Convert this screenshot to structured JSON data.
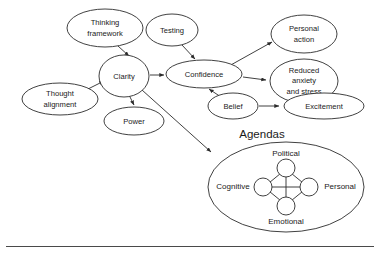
{
  "diagram": {
    "type": "concept-map",
    "background_color": "#ffffff",
    "stroke_color": "#2b2b2b",
    "text_color": "#1a1a1a",
    "nodes": [
      {
        "id": "thinking-framework",
        "label": "Thinking framework",
        "lines": [
          "Thinking",
          "framework"
        ],
        "shape": "ellipse",
        "cx": 105,
        "cy": 28,
        "rx": 38,
        "ry": 19
      },
      {
        "id": "thought-alignment",
        "label": "Thought alignment",
        "lines": [
          "Thought",
          "alignment"
        ],
        "shape": "ellipse",
        "cx": 60,
        "cy": 99,
        "rx": 38,
        "ry": 16
      },
      {
        "id": "clarity",
        "label": "Clarity",
        "lines": [
          "Clarity"
        ],
        "shape": "ellipse",
        "cx": 124,
        "cy": 76,
        "rx": 25,
        "ry": 21
      },
      {
        "id": "power",
        "label": "Power",
        "lines": [
          "Power"
        ],
        "shape": "ellipse",
        "cx": 134,
        "cy": 121,
        "rx": 30,
        "ry": 14
      },
      {
        "id": "testing",
        "label": "Testing",
        "lines": [
          "Testing"
        ],
        "shape": "ellipse",
        "cx": 172,
        "cy": 30,
        "rx": 26,
        "ry": 16
      },
      {
        "id": "confidence",
        "label": "Confidence",
        "lines": [
          "Confidence"
        ],
        "shape": "ellipse",
        "cx": 204,
        "cy": 74,
        "rx": 38,
        "ry": 14
      },
      {
        "id": "belief",
        "label": "Belief",
        "lines": [
          "Belief"
        ],
        "shape": "ellipse",
        "cx": 233,
        "cy": 106,
        "rx": 25,
        "ry": 13
      },
      {
        "id": "personal-action",
        "label": "Personal action",
        "lines": [
          "Personal",
          "action"
        ],
        "shape": "ellipse",
        "cx": 304,
        "cy": 34,
        "rx": 33,
        "ry": 19
      },
      {
        "id": "reduced-anxiety",
        "label": "Reduced anxiety and stress",
        "lines": [
          "Reduced",
          "anxiety",
          "and stress"
        ],
        "shape": "ellipse",
        "cx": 304,
        "cy": 81,
        "rx": 34,
        "ry": 22
      },
      {
        "id": "excitement",
        "label": "Excitement",
        "lines": [
          "Excitement"
        ],
        "shape": "ellipse",
        "cx": 324,
        "cy": 106,
        "rx": 40,
        "ry": 13
      }
    ],
    "edges": [
      {
        "id": "thinking-framework-to-clarity",
        "from": "thinking-framework",
        "to": "clarity",
        "arrow": true
      },
      {
        "id": "thought-alignment-to-clarity",
        "from": "thought-alignment",
        "to": "clarity",
        "arrow": true
      },
      {
        "id": "clarity-to-confidence",
        "from": "clarity",
        "to": "confidence",
        "arrow": true
      },
      {
        "id": "clarity-to-power",
        "from": "clarity",
        "to": "power",
        "arrow": true
      },
      {
        "id": "clarity-to-agendas",
        "from": "clarity",
        "to": "agendas",
        "arrow": true
      },
      {
        "id": "testing-to-confidence",
        "from": "testing",
        "to": "confidence",
        "arrow": true
      },
      {
        "id": "belief-to-confidence",
        "from": "belief",
        "to": "confidence",
        "arrow": true
      },
      {
        "id": "belief-to-excitement",
        "from": "belief",
        "to": "excitement",
        "arrow": true
      },
      {
        "id": "confidence-to-personal-action",
        "from": "confidence",
        "to": "personal-action",
        "arrow": true
      },
      {
        "id": "confidence-to-reduced-anxiety",
        "from": "confidence",
        "to": "reduced-anxiety",
        "arrow": true
      }
    ],
    "agendas": {
      "title": "Agendas",
      "outer": {
        "cx": 286,
        "cy": 187,
        "rx": 78,
        "ry": 45
      },
      "labels": {
        "top": "Political",
        "left": "Cognitive",
        "right": "Personal",
        "bottom": "Emotional"
      },
      "node_count": 4,
      "connection_style": "fully-connected"
    }
  }
}
